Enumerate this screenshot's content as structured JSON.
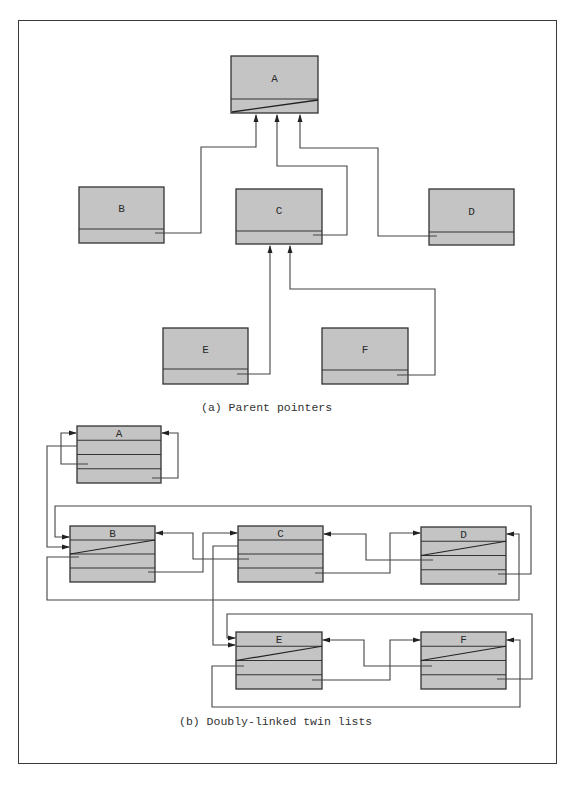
{
  "figure": {
    "caption_a": "(a) Parent pointers",
    "caption_b": "(b) Doubly-linked twin lists"
  },
  "colors": {
    "box_fill": "#c4c4c4",
    "box_stroke": "#333333",
    "line": "#444444",
    "frame": "#3a3a3a"
  },
  "part_a": {
    "title": "Parent pointers",
    "nodes": [
      {
        "id": "A",
        "label": "A",
        "x": 231,
        "y": 56,
        "w": 87,
        "h": 57,
        "split": 99,
        "nil": true
      },
      {
        "id": "B",
        "label": "B",
        "x": 79,
        "y": 187,
        "w": 85,
        "h": 56,
        "split": 229,
        "nil": false
      },
      {
        "id": "C",
        "label": "C",
        "x": 236,
        "y": 189,
        "w": 86,
        "h": 55,
        "split": 231,
        "nil": false
      },
      {
        "id": "D",
        "label": "D",
        "x": 429,
        "y": 189,
        "w": 85,
        "h": 56,
        "split": 232,
        "nil": false
      },
      {
        "id": "E",
        "label": "E",
        "x": 163,
        "y": 328,
        "w": 85,
        "h": 56,
        "split": 369,
        "nil": false
      },
      {
        "id": "F",
        "label": "F",
        "x": 322,
        "y": 328,
        "w": 86,
        "h": 56,
        "split": 370,
        "nil": false
      }
    ],
    "edges": [
      {
        "from": "B",
        "to": "A"
      },
      {
        "from": "C",
        "to": "A"
      },
      {
        "from": "D",
        "to": "A"
      },
      {
        "from": "E",
        "to": "C"
      },
      {
        "from": "F",
        "to": "C"
      }
    ]
  },
  "part_b": {
    "title": "Doubly-linked twin lists",
    "nodes": [
      {
        "id": "A",
        "label": "A",
        "x": 77,
        "y": 426,
        "w": 84,
        "h": 57
      },
      {
        "id": "B",
        "label": "B",
        "x": 70,
        "y": 526,
        "w": 85,
        "h": 56
      },
      {
        "id": "C",
        "label": "C",
        "x": 238,
        "y": 526,
        "w": 85,
        "h": 56
      },
      {
        "id": "D",
        "label": "D",
        "x": 421,
        "y": 527,
        "w": 85,
        "h": 57
      },
      {
        "id": "E",
        "label": "E",
        "x": 236,
        "y": 632,
        "w": 86,
        "h": 57
      },
      {
        "id": "F",
        "label": "F",
        "x": 421,
        "y": 632,
        "w": 85,
        "h": 57
      }
    ],
    "twin_lists": [
      [
        "A"
      ],
      [
        "B",
        "C",
        "D"
      ],
      [
        "E",
        "F"
      ]
    ]
  }
}
